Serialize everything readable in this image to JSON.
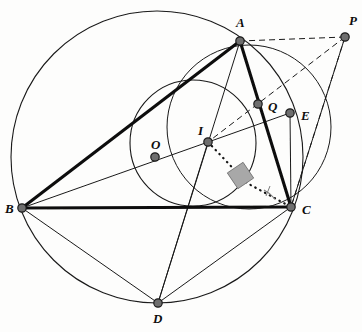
{
  "figure": {
    "canvas": {
      "width": 362,
      "height": 332,
      "background": "#fdfdfc"
    },
    "colors": {
      "stroke": "#1a1a1a",
      "thick_stroke": "#111111",
      "point_fill": "#6e6e6e",
      "point_edge": "#1a1a1a",
      "right_angle_fill": "#a8a8a8",
      "label": "#0d0d0d"
    },
    "points": [
      {
        "id": "A",
        "label": "A",
        "x": 240,
        "y": 41,
        "label_x": 236,
        "label_y": 16
      },
      {
        "id": "B",
        "label": "B",
        "x": 22,
        "y": 208,
        "label_x": 5,
        "label_y": 202
      },
      {
        "id": "C",
        "label": "C",
        "x": 291,
        "y": 207,
        "label_x": 302,
        "label_y": 203
      },
      {
        "id": "D",
        "label": "D",
        "x": 158,
        "y": 303,
        "label_x": 153,
        "label_y": 312
      },
      {
        "id": "E",
        "label": "E",
        "x": 290,
        "y": 113,
        "label_x": 301,
        "label_y": 109
      },
      {
        "id": "I",
        "label": "I",
        "x": 208,
        "y": 142,
        "label_x": 198,
        "label_y": 124
      },
      {
        "id": "O",
        "label": "O",
        "x": 155,
        "y": 157,
        "label_x": 151,
        "label_y": 138
      },
      {
        "id": "P",
        "label": "P",
        "x": 345,
        "y": 37,
        "label_x": 349,
        "label_y": 14
      },
      {
        "id": "Q",
        "label": "Q",
        "x": 258,
        "y": 104,
        "label_x": 268,
        "label_y": 100
      }
    ],
    "circles": [
      {
        "name": "circumcircle",
        "cx": 157,
        "cy": 157,
        "r": 146,
        "style": "solid"
      },
      {
        "name": "incircle",
        "cx": 193,
        "cy": 143,
        "r": 63,
        "style": "solid"
      },
      {
        "name": "circle-IQEC",
        "cx": 249,
        "cy": 127,
        "r": 82,
        "style": "solid"
      }
    ],
    "segments": [
      {
        "name": "AB",
        "from": "A",
        "to": "B",
        "weight": "thick",
        "style": "solid"
      },
      {
        "name": "AC",
        "from": "A",
        "to": "C",
        "weight": "thick",
        "style": "solid"
      },
      {
        "name": "BC",
        "from": "B",
        "to": "C",
        "weight": "thick",
        "style": "solid"
      },
      {
        "name": "AD",
        "from": "A",
        "to": "D",
        "weight": "thin",
        "style": "solid"
      },
      {
        "name": "BD",
        "from": "B",
        "to": "D",
        "weight": "thin",
        "style": "solid"
      },
      {
        "name": "CD",
        "from": "C",
        "to": "D",
        "weight": "thin",
        "style": "solid"
      },
      {
        "name": "BE",
        "from": "B",
        "to": "E",
        "weight": "thin",
        "style": "solid"
      },
      {
        "name": "BO-extended",
        "from": "B",
        "to": "E",
        "weight": "thin",
        "style": "solid"
      },
      {
        "name": "ID",
        "from": "I",
        "to": "D",
        "weight": "thin",
        "style": "solid"
      },
      {
        "name": "EC",
        "from": "E",
        "to": "C",
        "weight": "thin",
        "style": "solid"
      },
      {
        "name": "PA",
        "from": "P",
        "to": "A",
        "weight": "thin",
        "style": "dashed"
      },
      {
        "name": "PC",
        "from": "P",
        "to": "C",
        "weight": "thin",
        "style": "dashed"
      },
      {
        "name": "PI",
        "from": "P",
        "to": "I",
        "weight": "thin",
        "style": "dashed"
      },
      {
        "name": "PE-C",
        "from": "P",
        "to": "C",
        "weight": "thin",
        "style": "solid"
      },
      {
        "name": "IQ-foot",
        "from": "I",
        "to": "foot",
        "weight": "thin",
        "style": "dotted"
      },
      {
        "name": "foot-C",
        "from": "foot",
        "to": "C",
        "weight": "thin",
        "style": "dotted"
      }
    ],
    "markers": [
      {
        "name": "right-angle-square",
        "x": 240,
        "y": 175,
        "kind": "filled-square",
        "rotation": -34
      },
      {
        "name": "angle-arc-at-C",
        "x": 291,
        "y": 207,
        "kind": "arc"
      }
    ]
  }
}
